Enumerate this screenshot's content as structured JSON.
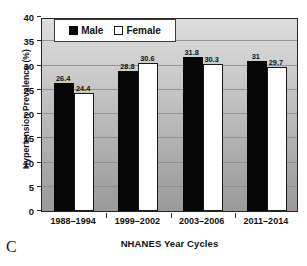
{
  "panel_label": "C",
  "legend": {
    "position": "top-left-inside",
    "entries": [
      {
        "label": "Male",
        "swatch": "filled-black-square",
        "color": "#060606"
      },
      {
        "label": "Female",
        "swatch": "open-white-square",
        "color": "#ffffff"
      }
    ]
  },
  "axes": {
    "ylabel": "Hypertension Prevalence (%)",
    "xlabel": "NHANES Year Cycles",
    "yticks": [
      0,
      5,
      10,
      15,
      20,
      25,
      30,
      35,
      40
    ],
    "ytick_labels": [
      "0",
      "5",
      "10",
      "15",
      "20",
      "25",
      "30",
      "35",
      "40"
    ]
  },
  "chart_data": {
    "type": "bar",
    "title": "",
    "subtitle": "",
    "xlabel": "NHANES Year Cycles",
    "ylabel": "Hypertension Prevalence (%)",
    "ylim": [
      0,
      40
    ],
    "ytick_step": 5,
    "grid": "horizontal",
    "legend_position": "upper-left-inside",
    "categories": [
      "1988–1994",
      "1999–2002",
      "2003–2006",
      "2011–2014"
    ],
    "series": [
      {
        "name": "Male",
        "color": "#060606",
        "values": [
          26.4,
          28.8,
          31.8,
          31
        ],
        "labels": [
          "26.4",
          "28.8",
          "31.8",
          "31"
        ]
      },
      {
        "name": "Female",
        "color": "#ffffff",
        "values": [
          24.4,
          30.6,
          30.3,
          29.7
        ],
        "labels": [
          "24.4",
          "30.6",
          "30.3",
          "29.7"
        ]
      }
    ]
  }
}
